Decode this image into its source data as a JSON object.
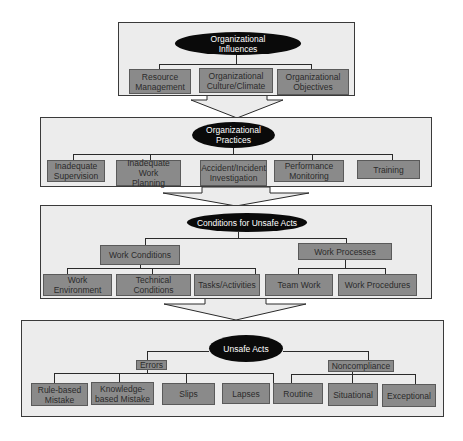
{
  "diagram": {
    "sections": [
      {
        "title": "Organizational\nInfluences",
        "children": [
          "Resource\nManagement",
          "Organizational\nCulture/Climate",
          "Organizational\nObjectives"
        ]
      },
      {
        "title": "Organizational\nPractices",
        "children": [
          "Inadequate\nSupervision",
          "Inadequate Work\nPlanning",
          "Accident/Incident\nInvestigation",
          "Performance\nMonitoring",
          "Training"
        ]
      },
      {
        "title": "Conditions for Unsafe Acts",
        "groups": [
          {
            "label": "Work Conditions",
            "children": [
              "Work Environment",
              "Technical Conditions",
              "Tasks/Activities"
            ]
          },
          {
            "label": "Work Processes",
            "children": [
              "Team Work",
              "Work Procedures"
            ]
          }
        ]
      },
      {
        "title": "Unsafe Acts",
        "groups": [
          {
            "label": "Errors",
            "children": [
              "Rule-based\nMistake",
              "Knowledge-\nbased Mistake",
              "Slips",
              "Lapses"
            ]
          },
          {
            "label": "Noncompliance",
            "children": [
              "Routine",
              "Situational",
              "Exceptional"
            ]
          }
        ]
      }
    ],
    "colors": {
      "section_bg": "#ececec",
      "box_bg": "#8a8a8a",
      "ellipse_bg": "#0a0a0a",
      "border": "#3a3a3a"
    }
  }
}
